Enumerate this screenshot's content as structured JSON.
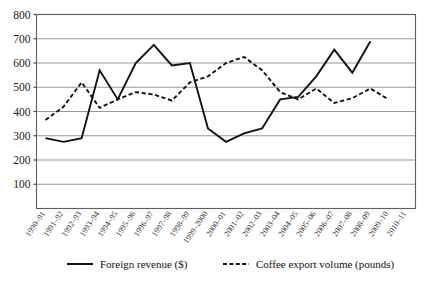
{
  "chart_data": {
    "type": "line",
    "title": "",
    "subtitle": "",
    "xlabel": "",
    "ylabel": "",
    "grid": true,
    "legend_position": "bottom",
    "ylim": [
      0,
      800
    ],
    "yticks": [
      100,
      200,
      300,
      400,
      500,
      600,
      700,
      800
    ],
    "ytick_labels": [
      "100",
      "200",
      "300",
      "400",
      "500",
      "600",
      "700",
      "800"
    ],
    "categories": [
      "1990–91",
      "1991–92",
      "1992–93",
      "1993–94",
      "1994–95",
      "1995–96",
      "1996–97",
      "1997–98",
      "1998–99",
      "1999–2000",
      "2000–01",
      "2001–02",
      "2002–03",
      "2003–04",
      "2004–05",
      "2005–06",
      "2006–07",
      "2007–08",
      "2008–09",
      "2009–10",
      "2010–11"
    ],
    "series": [
      {
        "name": "Foreign revenue ($)",
        "style": "solid",
        "color": "#111111",
        "values": [
          290,
          275,
          290,
          570,
          450,
          600,
          675,
          590,
          600,
          330,
          275,
          310,
          330,
          450,
          460,
          545,
          655,
          560,
          690,
          null,
          null
        ]
      },
      {
        "name": "Coffee export volume (pounds)",
        "style": "dashed",
        "color": "#111111",
        "values": [
          365,
          420,
          520,
          415,
          450,
          480,
          470,
          445,
          520,
          545,
          600,
          625,
          570,
          480,
          450,
          495,
          435,
          455,
          495,
          450,
          null
        ]
      }
    ]
  },
  "legend": {
    "items": [
      {
        "label": "Foreign revenue ($)",
        "style": "solid"
      },
      {
        "label": "Coffee export volume (pounds)",
        "style": "dashed"
      }
    ]
  }
}
